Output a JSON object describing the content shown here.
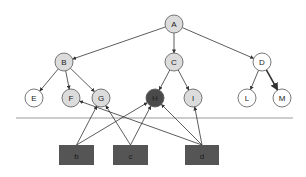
{
  "diagram": {
    "type": "tree-with-external-sources",
    "colors": {
      "light_node": "#dcdcdc",
      "white_node": "#ffffff",
      "dark_node": "#4a4a4a",
      "box_fill": "#555555",
      "edge": "#333333",
      "divider": "#9a9a9a"
    },
    "nodes": [
      {
        "id": "A",
        "label": "A",
        "x": 174,
        "y": 24,
        "style": "light"
      },
      {
        "id": "B",
        "label": "B",
        "x": 64,
        "y": 62,
        "style": "light"
      },
      {
        "id": "C",
        "label": "C",
        "x": 174,
        "y": 62,
        "style": "light"
      },
      {
        "id": "D",
        "label": "D",
        "x": 262,
        "y": 62,
        "style": "white"
      },
      {
        "id": "E",
        "label": "E",
        "x": 34,
        "y": 98,
        "style": "white"
      },
      {
        "id": "F",
        "label": "F",
        "x": 71,
        "y": 98,
        "style": "light"
      },
      {
        "id": "G",
        "label": "G",
        "x": 101,
        "y": 98,
        "style": "light"
      },
      {
        "id": "H",
        "label": "H",
        "x": 155,
        "y": 98,
        "style": "dark"
      },
      {
        "id": "I",
        "label": "I",
        "x": 193,
        "y": 98,
        "style": "light"
      },
      {
        "id": "L",
        "label": "L",
        "x": 247,
        "y": 98,
        "style": "white"
      },
      {
        "id": "M",
        "label": "M",
        "x": 282,
        "y": 98,
        "style": "white"
      }
    ],
    "boxes": [
      {
        "id": "b",
        "label": "b",
        "x": 59,
        "y": 145,
        "w": 35,
        "h": 20
      },
      {
        "id": "c",
        "label": "c",
        "x": 113,
        "y": 145,
        "w": 35,
        "h": 20
      },
      {
        "id": "d",
        "label": "d",
        "x": 185,
        "y": 145,
        "w": 34,
        "h": 20
      }
    ],
    "tree_edges": [
      {
        "from": "A",
        "to": "B"
      },
      {
        "from": "A",
        "to": "C"
      },
      {
        "from": "A",
        "to": "D"
      },
      {
        "from": "B",
        "to": "E"
      },
      {
        "from": "B",
        "to": "F"
      },
      {
        "from": "B",
        "to": "G"
      },
      {
        "from": "C",
        "to": "H"
      },
      {
        "from": "C",
        "to": "I"
      },
      {
        "from": "D",
        "to": "L"
      },
      {
        "from": "D",
        "to": "M",
        "bold": true
      }
    ],
    "source_edges": [
      {
        "from": "b",
        "to": "G"
      },
      {
        "from": "b",
        "to": "H"
      },
      {
        "from": "c",
        "to": "G"
      },
      {
        "from": "c",
        "to": "H"
      },
      {
        "from": "d",
        "to": "F"
      },
      {
        "from": "d",
        "to": "H"
      },
      {
        "from": "d",
        "to": "I"
      }
    ],
    "divider": {
      "x1": 16,
      "x2": 293,
      "y": 118
    }
  }
}
